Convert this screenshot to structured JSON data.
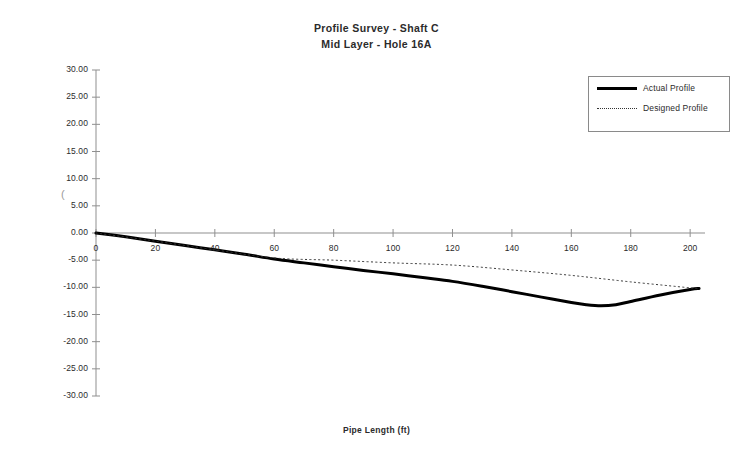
{
  "chart_data": {
    "type": "line",
    "title": "Profile Survey - Shaft C",
    "subtitle": "Mid Layer - Hole 16A",
    "xlabel": "Pipe Length (ft)",
    "ylabel": "Elevation (ft)",
    "xlim": [
      0,
      205
    ],
    "ylim": [
      -30,
      30
    ],
    "xticks": [
      0,
      20,
      40,
      60,
      80,
      100,
      120,
      140,
      160,
      180,
      200
    ],
    "xticklabels": [
      "0",
      "20",
      "40",
      "60",
      "80",
      "100",
      "120",
      "140",
      "160",
      "180",
      "200"
    ],
    "yticks": [
      30,
      25,
      20,
      15,
      10,
      5,
      0,
      -5,
      -10,
      -15,
      -20,
      -25,
      -30
    ],
    "yticklabels": [
      "30.00",
      "25.00",
      "20.00",
      "15.00",
      "10.00",
      "5.00",
      "0.00",
      "-5.00",
      "-10.00",
      "-15.00",
      "-20.00",
      "-25.00",
      "-30.00"
    ],
    "grid": false,
    "legend_position": "upper right",
    "series": [
      {
        "name": "Actual Profile",
        "style": "solid",
        "linewidth": 3,
        "color": "#000000",
        "x": [
          0,
          10,
          20,
          30,
          40,
          50,
          60,
          70,
          80,
          90,
          100,
          110,
          120,
          130,
          140,
          150,
          160,
          165,
          170,
          175,
          180,
          190,
          200,
          203
        ],
        "y": [
          0.0,
          -0.7,
          -1.5,
          -2.3,
          -3.1,
          -3.9,
          -4.8,
          -5.5,
          -6.2,
          -6.9,
          -7.5,
          -8.2,
          -8.9,
          -9.8,
          -10.8,
          -11.8,
          -12.8,
          -13.2,
          -13.4,
          -13.2,
          -12.6,
          -11.4,
          -10.4,
          -10.2
        ]
      },
      {
        "name": "Designed Profile",
        "style": "dotted",
        "linewidth": 1,
        "color": "#333333",
        "x": [
          0,
          20,
          40,
          60,
          80,
          100,
          120,
          140,
          160,
          180,
          200,
          203
        ],
        "y": [
          0.0,
          -1.5,
          -3.1,
          -4.6,
          -5.0,
          -5.5,
          -5.9,
          -6.8,
          -7.8,
          -9.0,
          -10.1,
          -10.3
        ]
      }
    ]
  },
  "legend": {
    "entries": [
      {
        "label": "Actual Profile"
      },
      {
        "label": "Designed Profile"
      }
    ]
  },
  "artifacts": {
    "stray_paren": "("
  }
}
